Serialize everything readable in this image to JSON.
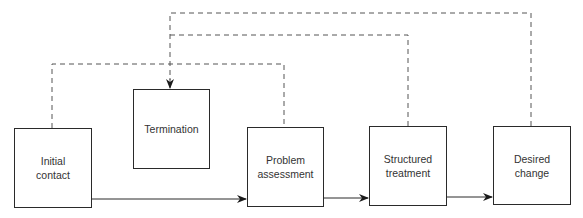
{
  "diagram": {
    "type": "flowchart",
    "colors": {
      "line": "#2a2a2a",
      "dashed": "#555555",
      "text": "#333333",
      "background": "#ffffff"
    },
    "nodes": [
      {
        "id": "initial-contact",
        "line1": "Initial",
        "line2": "contact"
      },
      {
        "id": "termination",
        "line1": "Termination",
        "line2": ""
      },
      {
        "id": "problem-assessment",
        "line1": "Problem",
        "line2": "assessment"
      },
      {
        "id": "structured-treatment",
        "line1": "Structured",
        "line2": "treatment"
      },
      {
        "id": "desired-change",
        "line1": "Desired",
        "line2": "change"
      }
    ],
    "edges": [
      {
        "from": "initial-contact",
        "to": "problem-assessment",
        "style": "solid"
      },
      {
        "from": "problem-assessment",
        "to": "structured-treatment",
        "style": "solid"
      },
      {
        "from": "structured-treatment",
        "to": "desired-change",
        "style": "solid"
      },
      {
        "from": "initial-contact",
        "to": "termination",
        "style": "dashed"
      },
      {
        "from": "problem-assessment",
        "to": "termination",
        "style": "dashed"
      },
      {
        "from": "structured-treatment",
        "to": "termination",
        "style": "dashed"
      },
      {
        "from": "desired-change",
        "to": "termination",
        "style": "dashed"
      }
    ]
  }
}
